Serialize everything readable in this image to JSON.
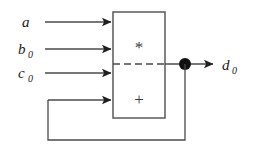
{
  "diagram": {
    "colors": {
      "wire": "#4a4a4a",
      "box_border": "#5a5a5a",
      "arrow_fill": "#1f1f1f",
      "junction": "#111111",
      "background": "#ffffff",
      "text": "#1a1a1a"
    },
    "inputs": [
      {
        "name": "input-a",
        "base": "a",
        "subscript": "",
        "label_x": 22,
        "label_y": 27,
        "wire_y": 22,
        "wire_x1": 45,
        "wire_x2": 113
      },
      {
        "name": "input-b0",
        "base": "b",
        "subscript": "0",
        "label_x": 18,
        "label_y": 54,
        "wire_y": 49,
        "wire_x1": 45,
        "wire_x2": 113
      },
      {
        "name": "input-c0",
        "base": "c",
        "subscript": "0",
        "label_x": 18,
        "label_y": 78,
        "wire_y": 73,
        "wire_x1": 45,
        "wire_x2": 113
      },
      {
        "name": "input-feedback",
        "base": "",
        "subscript": "",
        "label_x": 0,
        "label_y": 0,
        "wire_y": 100,
        "wire_x1": 48,
        "wire_x2": 113
      }
    ],
    "block": {
      "name": "mac-unit",
      "x": 113,
      "y": 12,
      "width": 52,
      "height": 106,
      "multiply_symbol": "*",
      "add_symbol": "+",
      "multiply_cx": 139,
      "multiply_cy": 47,
      "add_cx": 139,
      "add_cy": 99,
      "divider_y": 64
    },
    "output": {
      "name": "output-d0",
      "base": "d",
      "subscript": "0",
      "label_x": 222,
      "label_y": 70,
      "wire_y": 64,
      "wire_x1": 165,
      "wire_x2": 215,
      "junction_x": 185,
      "junction_y": 64,
      "junction_r": 6
    },
    "feedback": {
      "name": "feedback-path",
      "from_x": 185,
      "from_y": 64,
      "down_to_y": 140,
      "left_to_x": 48,
      "up_to_y": 100
    }
  }
}
